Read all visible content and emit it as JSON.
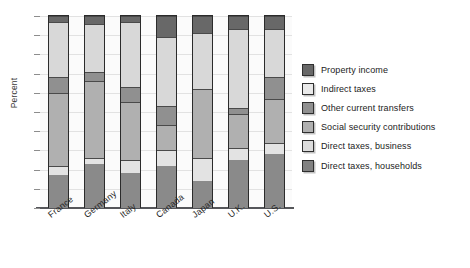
{
  "chart_data": {
    "type": "bar",
    "subtype": "stacked-bar-percent",
    "title": "",
    "xlabel": "",
    "ylabel": "Percent",
    "ylim": [
      0,
      100
    ],
    "grid": true,
    "y_tick_labels": [],
    "y_gridline_count": 10,
    "legend_position": "right",
    "categories": [
      "France",
      "Germany",
      "Italy",
      "Canada",
      "Japan",
      "U.K.",
      "U.S."
    ],
    "series": [
      {
        "name": "Direct taxes, households",
        "color": "#8a8a8a",
        "values": [
          17,
          23,
          18,
          22,
          14,
          25,
          28
        ]
      },
      {
        "name": "Direct taxes, business",
        "color": "#e3e3e3",
        "values": [
          5,
          3,
          7,
          8,
          12,
          6,
          6
        ]
      },
      {
        "name": "Social security contributions",
        "color": "#b0b0b0",
        "values": [
          38,
          40,
          30,
          13,
          36,
          18,
          23
        ]
      },
      {
        "name": "Other current transfers",
        "color": "#909090",
        "values": [
          8,
          5,
          8,
          10,
          0,
          3,
          11
        ]
      },
      {
        "name": "Indirect taxes",
        "color": "#d8d8d8",
        "values": [
          29,
          25,
          34,
          36,
          29,
          41,
          25
        ]
      },
      {
        "name": "Property income",
        "color": "#686868",
        "values": [
          3,
          4,
          3,
          11,
          9,
          7,
          7
        ]
      }
    ]
  },
  "legend": {
    "items": [
      {
        "label": "Property income",
        "color": "#686868"
      },
      {
        "label": "Indirect taxes",
        "color": "#e9e9e9"
      },
      {
        "label": "Other current transfers",
        "color": "#909090"
      },
      {
        "label": "Social security contributions",
        "color": "#b0b0b0"
      },
      {
        "label": "Direct taxes, business",
        "color": "#dcdcdc"
      },
      {
        "label": "Direct taxes, households",
        "color": "#828282"
      }
    ]
  },
  "axes": {
    "y_title": "Percent"
  }
}
